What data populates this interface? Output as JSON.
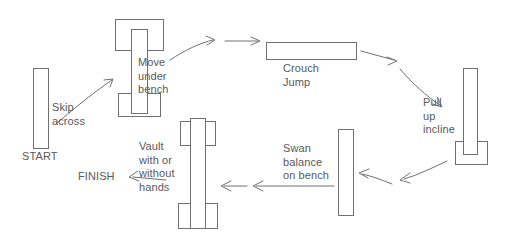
{
  "diagram": {
    "colors": {
      "stroke": "#6e7072",
      "text": "#58595b",
      "background": "#ffffff"
    },
    "labels": {
      "start": "START",
      "skip_across": "Skip\nacross",
      "move_under_bench": "Move\nunder\nbench",
      "crouch_jump": "Crouch\nJump",
      "pull_up_incline": "Pull\nup\nincline",
      "swan_balance": "Swan\nbalance\non bench",
      "vault": "Vault\nwith or\nwithout\nhands",
      "finish": "FINISH"
    },
    "stations": [
      {
        "name": "start-bar",
        "label": "START",
        "shape": "vertical-bar"
      },
      {
        "name": "move-under-bench",
        "label": "Move under bench",
        "shape": "bench-with-upright"
      },
      {
        "name": "crouch-jump-bar",
        "label": "Crouch Jump",
        "shape": "horizontal-bar"
      },
      {
        "name": "pull-up-incline",
        "label": "Pull up incline",
        "shape": "incline-on-box"
      },
      {
        "name": "swan-balance-bench",
        "label": "Swan balance on bench",
        "shape": "vertical-bar"
      },
      {
        "name": "vault-bench",
        "label": "Vault with or without hands",
        "shape": "bench-with-upright"
      }
    ],
    "flow_order": [
      "START",
      "Skip across",
      "Move under bench",
      "Crouch Jump",
      "Pull up incline",
      "Swan balance on bench",
      "Vault with or without hands",
      "FINISH"
    ]
  }
}
